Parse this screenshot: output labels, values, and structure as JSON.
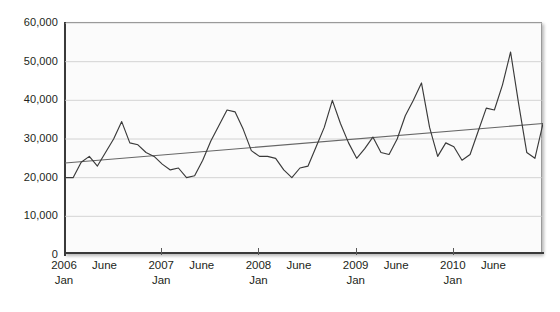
{
  "chart_data": {
    "type": "line",
    "title": "",
    "subtitle": "",
    "xlabel": "",
    "ylabel": "",
    "ylim": [
      0,
      60000
    ],
    "ytick_values": [
      60000,
      50000,
      40000,
      30000,
      20000,
      10000,
      0
    ],
    "ytick_labels": [
      "60,000",
      "50,000",
      "40,000",
      "30,000",
      "20,000",
      "10,000",
      "0"
    ],
    "grid": true,
    "grid_axis": "y",
    "legend": "none",
    "x_axis_type": "monthly-timeline",
    "x_tick_labels": [
      {
        "primary": "2006",
        "secondary": "Jan",
        "index": 0,
        "major": true
      },
      {
        "primary": "June",
        "secondary": "",
        "index": 5,
        "major": false
      },
      {
        "primary": "2007",
        "secondary": "Jan",
        "index": 12,
        "major": true
      },
      {
        "primary": "June",
        "secondary": "",
        "index": 17,
        "major": false
      },
      {
        "primary": "2008",
        "secondary": "Jan",
        "index": 24,
        "major": true
      },
      {
        "primary": "June",
        "secondary": "",
        "index": 29,
        "major": false
      },
      {
        "primary": "2009",
        "secondary": "Jan",
        "index": 36,
        "major": true
      },
      {
        "primary": "June",
        "secondary": "",
        "index": 41,
        "major": false
      },
      {
        "primary": "2010",
        "secondary": "Jan",
        "index": 48,
        "major": true
      },
      {
        "primary": "June",
        "secondary": "",
        "index": 53,
        "major": false
      }
    ],
    "x": [
      0,
      1,
      2,
      3,
      4,
      5,
      6,
      7,
      8,
      9,
      10,
      11,
      12,
      13,
      14,
      15,
      16,
      17,
      18,
      19,
      20,
      21,
      22,
      23,
      24,
      25,
      26,
      27,
      28,
      29,
      30,
      31,
      32,
      33,
      34,
      35,
      36,
      37,
      38,
      39,
      40,
      41,
      42,
      43,
      44,
      45,
      46,
      47,
      48,
      49,
      50,
      51,
      52,
      53,
      54,
      55,
      56,
      57,
      58,
      59
    ],
    "series": [
      {
        "name": "Monthly value",
        "type": "line",
        "color": "#3a3a3a",
        "values": [
          20000,
          20000,
          24000,
          25500,
          23000,
          26500,
          30000,
          34500,
          29000,
          28500,
          26500,
          25500,
          23500,
          22000,
          22500,
          20000,
          20500,
          24500,
          29500,
          33500,
          37500,
          37000,
          32500,
          27000,
          25500,
          25500,
          25000,
          22000,
          20000,
          22500,
          23000,
          28000,
          33000,
          40000,
          34000,
          29000,
          25000,
          27500,
          30500,
          26500,
          26000,
          30000,
          36000,
          40000,
          44500,
          33000,
          25500,
          29000,
          28000,
          24500,
          26000,
          32000,
          38000,
          37500,
          44000,
          52500,
          39000,
          26500,
          25000,
          34000
        ]
      },
      {
        "name": "Linear trend",
        "type": "trendline",
        "color": "#666666",
        "start_value": 23800,
        "end_value": 34000
      }
    ]
  }
}
